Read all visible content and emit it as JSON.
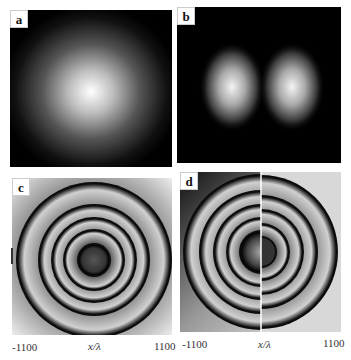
{
  "panels": [
    {
      "id": "a",
      "label": "a",
      "type": "intensity",
      "description": "single Gaussian beam intensity"
    },
    {
      "id": "b",
      "label": "b",
      "type": "intensity",
      "description": "two-lobe intensity pattern"
    },
    {
      "id": "c",
      "label": "c",
      "type": "phase",
      "description": "concentric phase rings"
    },
    {
      "id": "d",
      "label": "d",
      "type": "phase",
      "description": "phase rings with vertical dislocation"
    }
  ],
  "axes": {
    "c": {
      "xmin": "-1100",
      "xlabel": "x/λ",
      "xmax": "1100"
    },
    "d": {
      "xmin": "-1100",
      "xlabel": "x/λ",
      "xmax": "1100"
    }
  }
}
